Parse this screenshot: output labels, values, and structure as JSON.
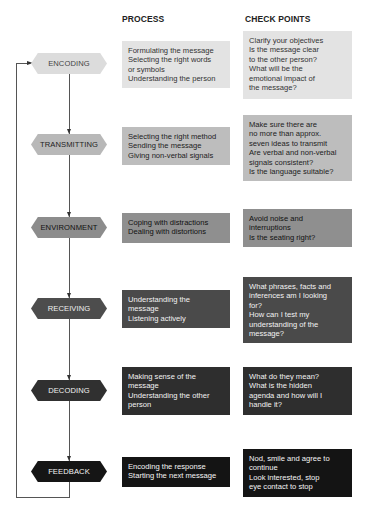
{
  "headers": {
    "process": "PROCESS",
    "check_points": "CHECK POINTS"
  },
  "stages": [
    {
      "label": "ENCODING",
      "process": "Formulating the message\nSelecting the right words\nor symbols\nUnderstanding the person",
      "check": "Clarify your objectives\nIs the message clear\nto the other person?\nWhat will be the\nemotional impact of\nthe message?"
    },
    {
      "label": "TRANSMITTING",
      "process": "Selecting the right method\nSending the message\nGiving non-verbal signals",
      "check": "Make sure there are\nno more than approx.\nseven ideas to transmit\nAre verbal and non-verbal\nsignals consistent?\nIs the language suitable?"
    },
    {
      "label": "ENVIRONMENT",
      "process": "Coping with distractions\nDealing with distortions",
      "check": "Avoid noise and\ninterruptions\nIs the seating right?"
    },
    {
      "label": "RECEIVING",
      "process": "Understanding the\nmessage\nListening actively",
      "check": "What phrases, facts and\ninferences am I looking\nfor?\nHow can I test my\nunderstanding of the\nmessage?"
    },
    {
      "label": "DECODING",
      "process": "Making sense of the\nmessage\nUnderstanding the other\nperson",
      "check": "What do they mean?\nWhat is the hidden\nagenda and how will I\nhandle it?"
    },
    {
      "label": "FEEDBACK",
      "process": "Encoding the response\nStarting the next message",
      "check": "Nod, smile and agree to\ncontinue\nLook interested, stop\neye contact to stop"
    }
  ]
}
